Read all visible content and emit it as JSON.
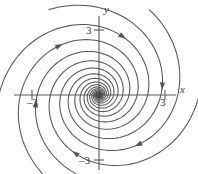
{
  "figure": {
    "background_color": "#ffffff",
    "curve_color": "#555555",
    "axis_color": "#5a5a5a",
    "text_color": "#3b3b3b"
  },
  "axes": {
    "x_label": "x",
    "y_label": "y",
    "origin": {
      "x": 99,
      "y": 95
    },
    "x_ticks": [
      {
        "label": "3",
        "value": -3,
        "px": 32
      },
      {
        "label": "3",
        "value": 3,
        "px": 165
      }
    ],
    "y_ticks": [
      {
        "label": "3",
        "value": 3,
        "px": 30
      },
      {
        "label": "3",
        "value": -3,
        "px": 160
      }
    ],
    "x_range": [
      -4.5,
      4.5
    ],
    "y_range": [
      -4.0,
      4.3
    ],
    "minus_signs": {
      "x_negative": "–",
      "y_negative": "–"
    }
  },
  "chart_data": {
    "type": "line",
    "xlabel": "x",
    "ylabel": "y",
    "xlim": [
      -4.5,
      4.5
    ],
    "ylim": [
      -4.0,
      4.3
    ],
    "grid": false,
    "legend": null,
    "equilibrium": {
      "x": 0,
      "y": 0,
      "type": "stable spiral (attracting focus)",
      "marker": "filled-dot"
    },
    "flow_direction": "clockwise inward",
    "spiral_model": {
      "form": "r(theta) = r0 * exp(-b * theta)",
      "decay_b": 0.23,
      "theta_sweep_turns": 2.6
    },
    "series": [
      {
        "name": "trajectory-1",
        "r0": 4.55,
        "theta0": 0.0,
        "arrow_t": 0.12
      },
      {
        "name": "trajectory-2",
        "r0": 4.55,
        "theta0": 1.05,
        "arrow_t": 0.12
      },
      {
        "name": "trajectory-3",
        "r0": 4.55,
        "theta0": 2.09,
        "arrow_t": 0.12
      },
      {
        "name": "trajectory-4",
        "r0": 4.55,
        "theta0": 3.14,
        "arrow_t": 0.12
      },
      {
        "name": "trajectory-5",
        "r0": 4.55,
        "theta0": 4.19,
        "arrow_t": 0.12
      },
      {
        "name": "trajectory-6",
        "r0": 4.55,
        "theta0": 5.24,
        "arrow_t": 0.12
      }
    ],
    "arrowheads": [
      {
        "x": -1.95,
        "y": 2.75,
        "direction": "left"
      },
      {
        "x": -0.95,
        "y": 1.95,
        "direction": "left"
      },
      {
        "x": -0.45,
        "y": 1.25,
        "direction": "left"
      },
      {
        "x": -0.3,
        "y": 0.7,
        "direction": "left"
      },
      {
        "x": 0.55,
        "y": -1.1,
        "direction": "right"
      },
      {
        "x": 1.05,
        "y": -1.95,
        "direction": "right"
      },
      {
        "x": 1.95,
        "y": -2.75,
        "direction": "right"
      },
      {
        "x": 2.5,
        "y": 0.95,
        "direction": "down"
      }
    ]
  }
}
